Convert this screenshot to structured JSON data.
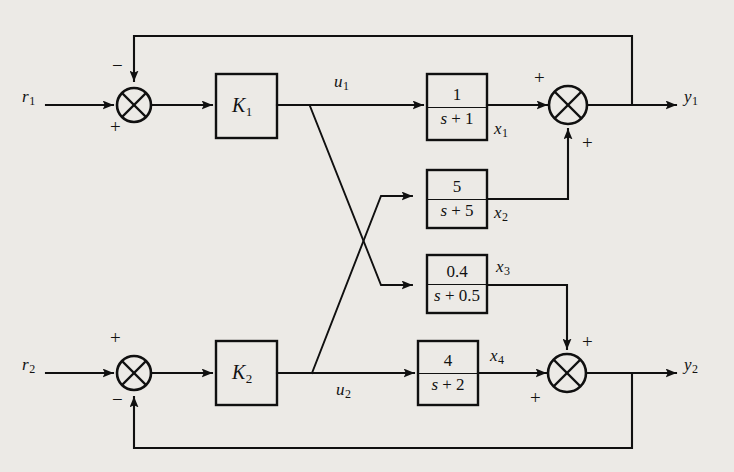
{
  "figure": {
    "kind": "control-system-block-diagram",
    "background_color": "#eceae6",
    "line_color": "#101010",
    "width": 734,
    "height": 472
  },
  "inputs": [
    {
      "id": "r1",
      "label": "r",
      "subscript": "1"
    },
    {
      "id": "r2",
      "label": "r",
      "subscript": "2"
    }
  ],
  "outputs": [
    {
      "id": "y1",
      "label": "y",
      "subscript": "1"
    },
    {
      "id": "y2",
      "label": "y",
      "subscript": "2"
    }
  ],
  "signals": [
    {
      "id": "u1",
      "label": "u",
      "subscript": "1"
    },
    {
      "id": "u2",
      "label": "u",
      "subscript": "2"
    },
    {
      "id": "x1",
      "label": "x",
      "subscript": "1"
    },
    {
      "id": "x2",
      "label": "x",
      "subscript": "2"
    },
    {
      "id": "x3",
      "label": "x",
      "subscript": "3"
    },
    {
      "id": "x4",
      "label": "x",
      "subscript": "4"
    }
  ],
  "gain_blocks": [
    {
      "id": "K1",
      "label": "K",
      "subscript": "1"
    },
    {
      "id": "K2",
      "label": "K",
      "subscript": "2"
    }
  ],
  "transfer_blocks": [
    {
      "id": "G1",
      "numerator": "1",
      "denominator_s": "s",
      "denominator_op": "+",
      "denominator_const": "1",
      "output_signal": "x1"
    },
    {
      "id": "G2",
      "numerator": "5",
      "denominator_s": "s",
      "denominator_op": "+",
      "denominator_const": "5",
      "output_signal": "x2"
    },
    {
      "id": "G3",
      "numerator": "0.4",
      "denominator_s": "s",
      "denominator_op": "+",
      "denominator_const": "0.5",
      "output_signal": "x3"
    },
    {
      "id": "G4",
      "numerator": "4",
      "denominator_s": "s",
      "denominator_op": "+",
      "denominator_const": "2",
      "output_signal": "x4"
    }
  ],
  "summing_junctions": [
    {
      "id": "sum-r1",
      "feedback_sign": "−",
      "input_sign": "+"
    },
    {
      "id": "sum-y1",
      "top_sign": "+",
      "bottom_sign": "+"
    },
    {
      "id": "sum-r2",
      "input_sign": "+",
      "feedback_sign": "−"
    },
    {
      "id": "sum-y2",
      "top_sign": "+",
      "bottom_sign": "+"
    }
  ],
  "signs": {
    "plus": "+",
    "minus": "−"
  }
}
